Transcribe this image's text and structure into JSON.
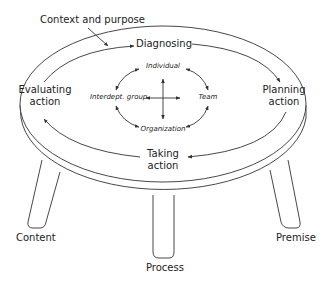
{
  "diagram": {
    "type": "three-legged stool (action research cycle)",
    "context_label": "Context and purpose",
    "cycle": {
      "steps": [
        {
          "line1": "Diagnosing",
          "line2": ""
        },
        {
          "line1": "Planning",
          "line2": "action"
        },
        {
          "line1": "Taking",
          "line2": "action"
        },
        {
          "line1": "Evaluating",
          "line2": "action"
        }
      ],
      "direction": "clockwise"
    },
    "levels": [
      "Individual",
      "Team",
      "Organization",
      "Interdept. group"
    ],
    "legs": [
      "Content",
      "Process",
      "Premise"
    ],
    "colors": {
      "line": "#333333",
      "text": "#222222",
      "background": "#ffffff"
    }
  }
}
